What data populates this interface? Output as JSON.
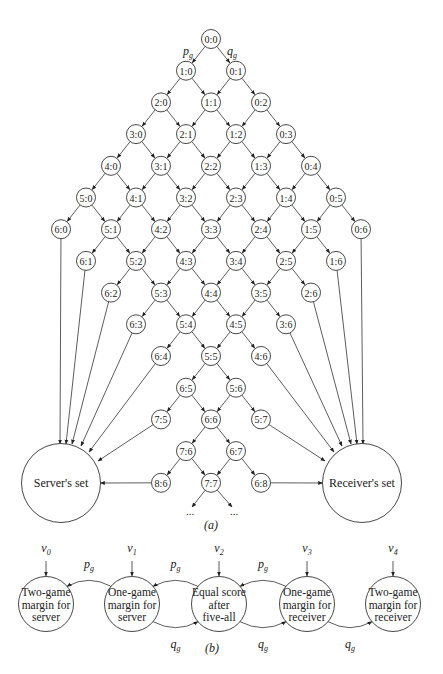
{
  "panel_a": {
    "label": "(a)",
    "edge_probabilities": {
      "left": "p",
      "left_sub": "g",
      "right": "q",
      "right_sub": "g"
    },
    "nodes": [
      "0:0",
      "1:0",
      "0:1",
      "2:0",
      "1:1",
      "0:2",
      "3:0",
      "2:1",
      "1:2",
      "0:3",
      "4:0",
      "3:1",
      "2:2",
      "1:3",
      "0:4",
      "5:0",
      "4:1",
      "3:2",
      "2:3",
      "1:4",
      "0:5",
      "6:0",
      "5:1",
      "4:2",
      "3:3",
      "2:4",
      "1:5",
      "0:6",
      "6:1",
      "5:2",
      "4:3",
      "3:4",
      "2:5",
      "1:6",
      "6:2",
      "5:3",
      "4:4",
      "3:5",
      "2:6",
      "6:3",
      "5:4",
      "4:5",
      "3:6",
      "6:4",
      "5:5",
      "4:6",
      "6:5",
      "5:6",
      "7:5",
      "6:6",
      "5:7",
      "7:6",
      "6:7",
      "8:6",
      "7:7",
      "6:8"
    ],
    "server_terminals": [
      "6:0",
      "6:1",
      "6:2",
      "6:3",
      "6:4",
      "7:5",
      "8:6"
    ],
    "receiver_terminals": [
      "0:6",
      "1:6",
      "2:6",
      "3:6",
      "4:6",
      "5:7",
      "6:8"
    ],
    "continuation": "...",
    "server_set": {
      "label": "Server's set"
    },
    "receiver_set": {
      "label": "Receiver's set"
    }
  },
  "panel_b": {
    "label": "(b)",
    "states": [
      {
        "id": "s0",
        "v": "v",
        "v_sub": "0",
        "lines": [
          "Two-game",
          "margin for",
          "server"
        ]
      },
      {
        "id": "s1",
        "v": "v",
        "v_sub": "1",
        "lines": [
          "One-game",
          "margin for",
          "server"
        ]
      },
      {
        "id": "s2",
        "v": "v",
        "v_sub": "2",
        "lines": [
          "Equal score",
          "after",
          "five-all"
        ]
      },
      {
        "id": "s3",
        "v": "v",
        "v_sub": "3",
        "lines": [
          "One-game",
          "margin for",
          "receiver"
        ]
      },
      {
        "id": "s4",
        "v": "v",
        "v_sub": "4",
        "lines": [
          "Two-game",
          "margin for",
          "receiver"
        ]
      }
    ],
    "transitions": [
      {
        "from": "s1",
        "to": "s0",
        "prob": "p",
        "sub": "g",
        "side": "top"
      },
      {
        "from": "s2",
        "to": "s1",
        "prob": "p",
        "sub": "g",
        "side": "top"
      },
      {
        "from": "s3",
        "to": "s2",
        "prob": "p",
        "sub": "g",
        "side": "top"
      },
      {
        "from": "s1",
        "to": "s2",
        "prob": "q",
        "sub": "g",
        "side": "bottom"
      },
      {
        "from": "s2",
        "to": "s3",
        "prob": "q",
        "sub": "g",
        "side": "bottom"
      },
      {
        "from": "s3",
        "to": "s4",
        "prob": "q",
        "sub": "g",
        "side": "bottom"
      }
    ]
  },
  "colors": {
    "stroke": "#333333",
    "text": "#222222",
    "background": "#ffffff"
  }
}
